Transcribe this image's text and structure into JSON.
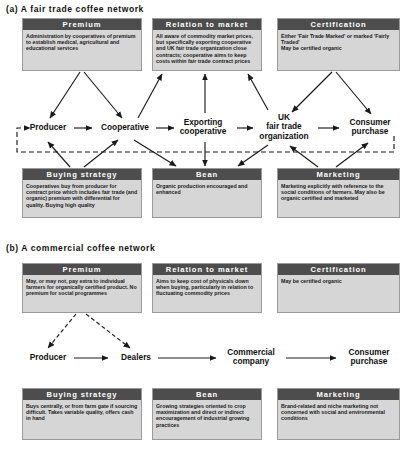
{
  "figure": {
    "panels": [
      {
        "id": "a",
        "caption": "(a) A fair trade coffee network",
        "top_cards": [
          {
            "title": "Premium",
            "body": "Administration by cooperatives of premium to establish medical, agricultural and educational services"
          },
          {
            "title": "Relation to market",
            "body": "All aware of commodity market prices, but specifically exporting cooperative and UK fair trade organization close contracts; cooperative aims to keep costs within fair trade contract prices"
          },
          {
            "title": "Certification",
            "body": "Either 'Fair Trade Marked' or marked 'Fairly Traded'\nMay be certified organic"
          }
        ],
        "chain": [
          "Producer",
          "Cooperative",
          "Exporting\ncooperative",
          "UK\nfair trade\norganization",
          "Consumer\npurchase"
        ],
        "bottom_cards": [
          {
            "title": "Buying strategy",
            "body": "Cooperatives buy from producer for contract price which includes fair trade (and organic) premium with differential for quality. Buying high quality"
          },
          {
            "title": "Bean",
            "body": "Organic production encouraged and enhanced"
          },
          {
            "title": "Marketing",
            "body": "Marketing explicitly with reference to the social conditions of farmers. May also be organic certified and marketed"
          }
        ]
      },
      {
        "id": "b",
        "caption": "(b) A commercial coffee network",
        "top_cards": [
          {
            "title": "Premium",
            "body": "May, or may not, pay extra to individual farmers for organically certified product. No premium for social programmes"
          },
          {
            "title": "Relation to market",
            "body": "Aims to keep cost of physicals down when buying, particularly in relation to fluctuating commodity prices"
          },
          {
            "title": "Certification",
            "body": "May be certified organic"
          }
        ],
        "chain": [
          "Producer",
          "Dealers",
          "Commercial\ncompany",
          "Consumer\npurchase"
        ],
        "bottom_cards": [
          {
            "title": "Buying strategy",
            "body": "Buys centrally, or from farm gate if sourcing difficult. Takes variable quality, offers cash in hand"
          },
          {
            "title": "Bean",
            "body": "Growing strategies oriented to crop maximization and direct or indirect encouragement of industrial growing practices"
          },
          {
            "title": "Marketing",
            "body": "Brand-related and niche marketing not concerned with social and environmental conditions"
          }
        ]
      }
    ]
  },
  "colors": {
    "card_header": "#4d4d4d",
    "card_body": "#d6d6d6",
    "card_border": "#9a9a9a",
    "arrow": "#1a1a1a",
    "text": "#111111",
    "background": "#ffffff"
  }
}
